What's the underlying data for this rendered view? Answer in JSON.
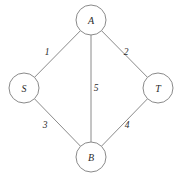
{
  "diagram": {
    "type": "graph",
    "background_color": "#ffffff",
    "stroke_color": "#8a8a8a",
    "text_color": "#2b2b2b",
    "node_radius": 15,
    "nodes": [
      {
        "id": "A",
        "label": "A",
        "cx": 91,
        "cy": 20
      },
      {
        "id": "S",
        "label": "S",
        "cx": 24,
        "cy": 88
      },
      {
        "id": "T",
        "label": "T",
        "cx": 158,
        "cy": 88
      },
      {
        "id": "B",
        "label": "B",
        "cx": 91,
        "cy": 157
      }
    ],
    "edges": [
      {
        "id": "S-A",
        "from": "S",
        "to": "A",
        "weight": "1",
        "label_x": 47,
        "label_y": 52
      },
      {
        "id": "A-T",
        "from": "A",
        "to": "T",
        "weight": "2",
        "label_x": 126,
        "label_y": 52
      },
      {
        "id": "S-B",
        "from": "S",
        "to": "B",
        "weight": "3",
        "label_x": 45,
        "label_y": 125
      },
      {
        "id": "B-T",
        "from": "B",
        "to": "T",
        "weight": "4",
        "label_x": 127,
        "label_y": 125
      },
      {
        "id": "A-B",
        "from": "A",
        "to": "B",
        "weight": "5",
        "label_x": 96,
        "label_y": 88
      }
    ]
  }
}
